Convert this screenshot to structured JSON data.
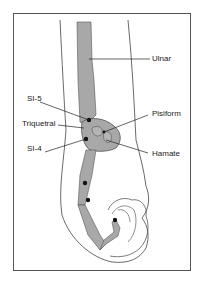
{
  "figure": {
    "title": "",
    "bone_fill": "#a8a8a8",
    "outline_color": "#333333",
    "point_color": "#111111"
  },
  "labels": {
    "ulnar": "Ulnar",
    "si5": "SI-5",
    "triquetral": "Triquetral",
    "pisiform": "Pisiform",
    "si4": "SI-4",
    "hamate": "Hamate"
  }
}
